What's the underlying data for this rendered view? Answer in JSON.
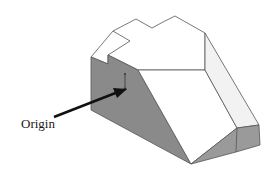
{
  "figure": {
    "label": "Origin",
    "colors": {
      "edge": "#555555",
      "shaded_face": "#8a8a8a",
      "light_face": "#ffffff",
      "side_face": "#f0f0f0",
      "bottom_face": "#9a9a9a",
      "arrow": "#111111"
    }
  }
}
